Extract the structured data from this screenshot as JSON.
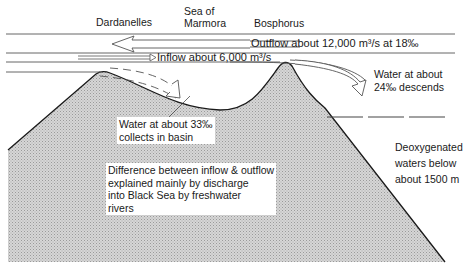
{
  "labels": {
    "dardanelles": "Dardanelles",
    "sea_of_marmora_line1": "Sea of",
    "sea_of_marmora_line2": "Marmora",
    "bosphorus": "Bosphorus",
    "outflow": "Outflow about 12,000 m³/s at 18‰",
    "inflow": "Inflow about 6,000 m³/s",
    "descends_line1": "Water at about",
    "descends_line2": "24‰ descends",
    "basin_line1": "Water at about 33‰",
    "basin_line2": "collects in basin",
    "difference_line1": "Difference between inflow & outflow",
    "difference_line2": "explained mainly by discharge",
    "difference_line3": "into Black Sea by freshwater",
    "difference_line4": "rivers",
    "deoxygenated_line1": "Deoxygenated",
    "deoxygenated_line2": "waters below",
    "deoxygenated_line3": "about 1500 m"
  },
  "colors": {
    "ink": "#1a1a1a",
    "hatch_fill": "#c8c8c8",
    "line": "#555555",
    "background": "#ffffff"
  }
}
